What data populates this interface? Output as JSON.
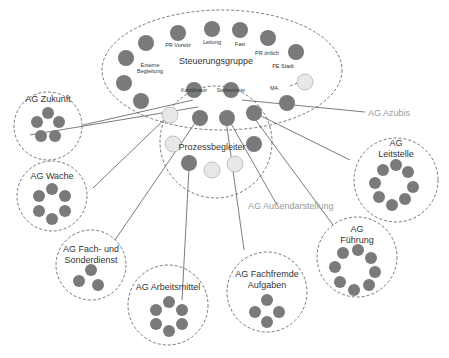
{
  "diagram": {
    "steering_group": {
      "title": "Steuerungsgruppe",
      "members": [
        "PR Vorsitz",
        "Leitung",
        "Fasi",
        "PR örtlich",
        "PE Stadt",
        "Externe Begleitung",
        "MA",
        "Koordinator",
        "Stellvertreter"
      ]
    },
    "process_group": {
      "title": "Prozessbegleiter"
    },
    "working_groups": [
      {
        "id": "zukunft",
        "line1": "AG Zukunft",
        "line2": "",
        "members": 5
      },
      {
        "id": "wache",
        "line1": "AG Wache",
        "line2": "",
        "members": 6
      },
      {
        "id": "fach",
        "line1": "AG Fach- und",
        "line2": "Sonderdienst",
        "members": 3
      },
      {
        "id": "arbeitsmittel",
        "line1": "AG Arbeitsmittel",
        "line2": "",
        "members": 6
      },
      {
        "id": "fachfremde",
        "line1": "AG Fachfremde",
        "line2": "Aufgaben",
        "members": 4
      },
      {
        "id": "fuehrung",
        "line1": "AG",
        "line2": "Führung",
        "members": 8
      },
      {
        "id": "leitstelle",
        "line1": "AG",
        "line2": "Leitstelle",
        "members": 8
      }
    ],
    "external_labels": {
      "azubis": "AG Azubis",
      "aussendarstellung": "AG Außendarstellung"
    }
  }
}
